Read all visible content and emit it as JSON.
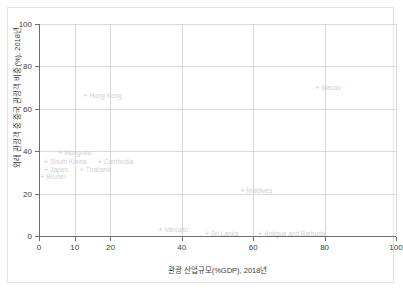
{
  "chart_data": {
    "type": "scatter",
    "title": "",
    "xlabel": "관광 산업규모(%GDP), 2018년",
    "ylabel": "외래 관광객 중 중국 관광객 비중(%), 2018년",
    "xlim": [
      0,
      100
    ],
    "ylim": [
      0,
      100
    ],
    "xticks": [
      0,
      10,
      20,
      40,
      60,
      80,
      100
    ],
    "yticks": [
      0,
      20,
      40,
      60,
      80,
      100
    ],
    "grid": true,
    "legend": "none",
    "marker": "+",
    "points": [
      {
        "label": "Hong Kong",
        "x": 13,
        "y": 66
      },
      {
        "label": "Macau",
        "x": 78,
        "y": 70
      },
      {
        "label": "Mongolia",
        "x": 6,
        "y": 39
      },
      {
        "label": "South Korea",
        "x": 2,
        "y": 35
      },
      {
        "label": "Cambodia",
        "x": 17,
        "y": 35
      },
      {
        "label": "Japan",
        "x": 2,
        "y": 31
      },
      {
        "label": "Thailand",
        "x": 12,
        "y": 31
      },
      {
        "label": "Brunei",
        "x": 1,
        "y": 28
      },
      {
        "label": "Maldives",
        "x": 57,
        "y": 21
      },
      {
        "label": "Vanuatu",
        "x": 34,
        "y": 3
      },
      {
        "label": "Sri Lanka",
        "x": 47,
        "y": 1
      },
      {
        "label": "Antigua and Barbuda",
        "x": 62,
        "y": 1
      }
    ]
  },
  "axis": {
    "xtick_labels": [
      "0",
      "10",
      "20",
      "40",
      "60",
      "80",
      "100"
    ],
    "ytick_labels": [
      "0",
      "20",
      "40",
      "60",
      "80",
      "100"
    ]
  }
}
